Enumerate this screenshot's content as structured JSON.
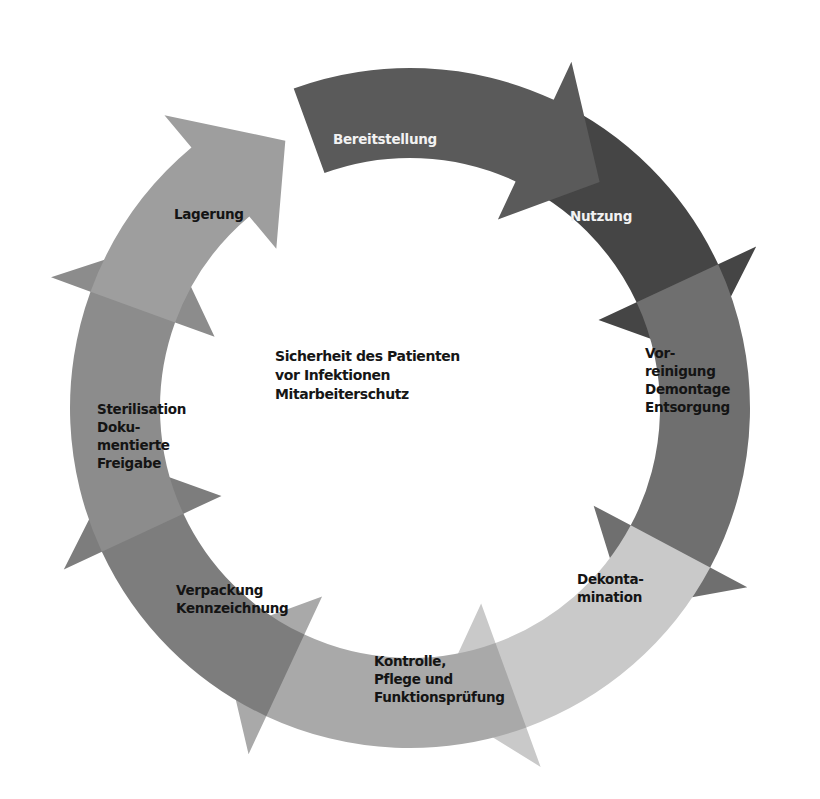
{
  "diagram": {
    "type": "cycle",
    "center_text": {
      "lines": [
        "Sicherheit des Patienten",
        "vor Infektionen",
        "Mitarbeiterschutz"
      ]
    },
    "steps": [
      {
        "id": "bereitstellung",
        "label": "Bereitstellung",
        "color": "#5a5a5a",
        "text_color": "#f2f2f2"
      },
      {
        "id": "nutzung",
        "label": "Nutzung",
        "color": "#454545",
        "text_color": "#f2f2f2"
      },
      {
        "id": "vorreinigung",
        "label": "Vor-\nreinigung\nDemontage\nEntsorgung",
        "color": "#6f6f6f",
        "text_color": "#141414"
      },
      {
        "id": "dekontamination",
        "label": "Dekonta-\nmination",
        "color": "#c9c9c9",
        "text_color": "#141414"
      },
      {
        "id": "kontrolle",
        "label": "Kontrolle,\nPflege und\nFunktionsprüfung",
        "color": "#a9a9a9",
        "text_color": "#141414"
      },
      {
        "id": "verpackung",
        "label": "Verpackung\nKennzeichnung",
        "color": "#7d7d7d",
        "text_color": "#141414"
      },
      {
        "id": "sterilisation",
        "label": "Sterilisation\nDoku-\nmentierte\nFreigabe",
        "color": "#8c8c8c",
        "text_color": "#141414"
      },
      {
        "id": "lagerung",
        "label": "Lagerung",
        "color": "#9e9e9e",
        "text_color": "#141414"
      }
    ]
  }
}
